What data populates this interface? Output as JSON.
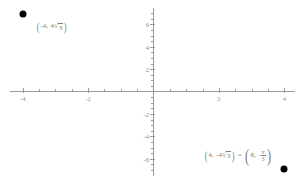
{
  "chart_data": {
    "type": "scatter",
    "title": "",
    "xlabel": "",
    "ylabel": "",
    "xlim": [
      -4.6,
      4.6
    ],
    "ylim": [
      -7.2,
      7.2
    ],
    "grid": false,
    "legend": "none",
    "x_ticks": [
      -4,
      -2,
      2,
      4
    ],
    "x_tick_labels": [
      "-4",
      "-2",
      "2",
      "4"
    ],
    "y_ticks": [
      6,
      4,
      2,
      -2,
      -4,
      -6
    ],
    "y_tick_labels": [
      "6",
      "4",
      "2",
      "-2",
      "-4",
      "-6"
    ],
    "x_minor_step": 0.5,
    "y_minor_step": 0.5,
    "point_color": "#000000",
    "axis_color": "#9a9a9a",
    "label_color": "#7d7d7d",
    "points": [
      {
        "name": "point-upper-left",
        "x": -4,
        "y": 6.928,
        "y_exact": "4*sqrt(3)",
        "label_rect": "(-4, 4√3)"
      },
      {
        "name": "point-lower-right",
        "x": 4,
        "y": -6.928,
        "y_exact": "-4*sqrt(3)",
        "label_rect": "(4, -4√3)",
        "label_polar": "(8, -π/3)",
        "label_full": "(4, -4√3) = (8, -π/3)"
      }
    ],
    "annotations": [
      {
        "name": "rect-label-upper",
        "text": "(-4, 4√3)",
        "open_paren": "(",
        "x_value": "-4",
        "comma": ",",
        "coef": "4",
        "radical_sign": "√",
        "radicand": "3",
        "close_paren": ")"
      },
      {
        "name": "rect-polar-equation-lower",
        "open_paren": "(",
        "x_value": "4",
        "comma": ",",
        "coef": "-4",
        "radical_sign": "√",
        "radicand": "3",
        "close_paren": ")",
        "equals": "=",
        "polar_open_paren": "(",
        "r_value": "8",
        "polar_comma": ",",
        "theta_sign": "-",
        "theta_num": "π",
        "theta_den": "3",
        "polar_close_paren": ")"
      }
    ]
  }
}
